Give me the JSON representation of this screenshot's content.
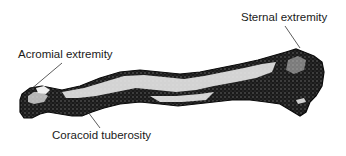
{
  "figure": {
    "labels": {
      "acromial": "Acromial extremity",
      "sternal": "Sternal extremity",
      "coracoid": "Coracoid tuberosity"
    },
    "colors": {
      "bone_dark": "#111111",
      "bone_light": "#f2f2f2",
      "leader_line": "#333333",
      "text": "#1a1a1a",
      "background": "#ffffff"
    }
  }
}
